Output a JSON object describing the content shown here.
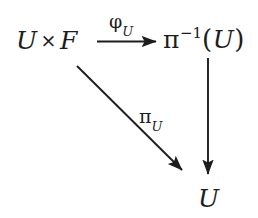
{
  "diagram": {
    "kind": "commutative-diagram",
    "background_color": "#ffffff",
    "stroke_color": "#1d1d1d",
    "nodes": [
      {
        "id": "source",
        "text": "U × F",
        "parts": {
          "left": "U",
          "operator": "×",
          "right": "F"
        },
        "position": {
          "x": 16,
          "y": 28
        }
      },
      {
        "id": "target",
        "text": "π⁻¹(U)",
        "parts": {
          "base": "π",
          "superscript": "−1",
          "open": "(",
          "argument": "U",
          "close": ")"
        },
        "position": {
          "x": 163,
          "y": 26
        }
      },
      {
        "id": "base",
        "text": "U",
        "parts": {
          "symbol": "U"
        },
        "position": {
          "x": 198,
          "y": 186
        }
      }
    ],
    "arrows": [
      {
        "id": "horizontal",
        "from": "source",
        "to": "target",
        "label": "φ_U",
        "label_base": "φ",
        "label_subscript": "U",
        "style": "solid",
        "head": "filled"
      },
      {
        "id": "diagonal",
        "from": "source",
        "to": "base",
        "label": "π_U",
        "label_base": "π",
        "label_subscript": "U",
        "style": "solid",
        "head": "filled"
      },
      {
        "id": "vertical",
        "from": "target",
        "to": "base",
        "label": "",
        "style": "solid",
        "head": "filled"
      }
    ]
  }
}
